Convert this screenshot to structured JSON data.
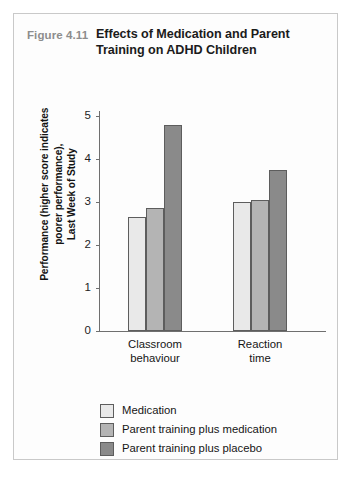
{
  "figure": {
    "number": "Figure 4.11",
    "title": "Effects of Medication and Parent Training on ADHD Children"
  },
  "chart_data": {
    "type": "bar",
    "title": "Effects of Medication and Parent Training on ADHD Children",
    "xlabel": "",
    "ylabel": "Performance (higher score indicates poorer performance), Last Week of Study",
    "ylabel_lines": [
      "Performance (higher score indicates",
      "poorer performance),",
      "Last Week of Study"
    ],
    "categories": [
      "Classroom behaviour",
      "Reaction time"
    ],
    "category_lines": [
      [
        "Classroom",
        "behaviour"
      ],
      [
        "Reaction",
        "time"
      ]
    ],
    "series": [
      {
        "name": "Medication",
        "values": [
          2.65,
          3.0
        ],
        "color": "#e9e9e9"
      },
      {
        "name": "Parent training plus medication",
        "values": [
          2.85,
          3.05
        ],
        "color": "#b4b4b4"
      },
      {
        "name": "Parent training plus placebo",
        "values": [
          4.8,
          3.75
        ],
        "color": "#8a8a8a"
      }
    ],
    "ylim": [
      0,
      5
    ],
    "yticks": [
      0,
      1,
      2,
      3,
      4,
      5
    ],
    "ytick_labels": [
      "0",
      "1",
      "2",
      "3",
      "4",
      "5"
    ],
    "grid": false,
    "legend_position": "bottom-left"
  }
}
